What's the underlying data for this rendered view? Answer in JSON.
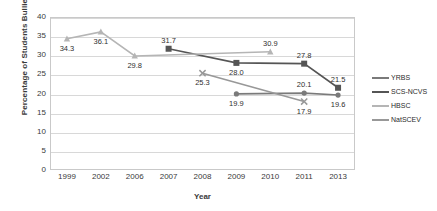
{
  "chart_data": {
    "type": "line",
    "title": "",
    "xlabel": "Year",
    "ylabel": "Percentage of Students Bullied",
    "categories": [
      "1999",
      "2002",
      "2006",
      "2007",
      "2008",
      "2009",
      "2010",
      "2011",
      "2013"
    ],
    "ylim": [
      0,
      40
    ],
    "yticks": [
      0,
      5,
      10,
      15,
      20,
      25,
      30,
      35,
      40
    ],
    "grid": true,
    "legend_position": "right",
    "series": [
      {
        "name": "YRBS",
        "color": "#7a7a7a",
        "marker": "circle",
        "points": [
          {
            "x": "2009",
            "y": 19.9,
            "label": "19.9",
            "label_pos": "below"
          },
          {
            "x": "2011",
            "y": 20.1,
            "label": "20.1",
            "label_pos": "above"
          },
          {
            "x": "2013",
            "y": 19.6,
            "label": "19.6",
            "label_pos": "below"
          }
        ]
      },
      {
        "name": "SCS-NCVS",
        "color": "#555555",
        "marker": "square",
        "points": [
          {
            "x": "2007",
            "y": 31.7,
            "label": "31.7",
            "label_pos": "above"
          },
          {
            "x": "2009",
            "y": 28.0,
            "label": "28.0",
            "label_pos": "below"
          },
          {
            "x": "2011",
            "y": 27.8,
            "label": "27.8",
            "label_pos": "above"
          },
          {
            "x": "2013",
            "y": 21.5,
            "label": "21.5",
            "label_pos": "above"
          }
        ]
      },
      {
        "name": "HBSC",
        "color": "#b5b5b5",
        "marker": "triangle",
        "points": [
          {
            "x": "1999",
            "y": 34.3,
            "label": "34.3",
            "label_pos": "below"
          },
          {
            "x": "2002",
            "y": 36.1,
            "label": "36.1",
            "label_pos": "below"
          },
          {
            "x": "2006",
            "y": 29.8,
            "label": "29.8",
            "label_pos": "below"
          },
          {
            "x": "2010",
            "y": 30.9,
            "label": "30.9",
            "label_pos": "above"
          }
        ]
      },
      {
        "name": "NatSCEV",
        "color": "#989898",
        "marker": "x",
        "points": [
          {
            "x": "2008",
            "y": 25.3,
            "label": "25.3",
            "label_pos": "below"
          },
          {
            "x": "2011",
            "y": 17.9,
            "label": "17.9",
            "label_pos": "below"
          }
        ]
      }
    ]
  },
  "legend": {
    "items": [
      {
        "label": "YRBS"
      },
      {
        "label": "SCS-NCVS"
      },
      {
        "label": "HBSC"
      },
      {
        "label": "NatSCEV"
      }
    ]
  }
}
